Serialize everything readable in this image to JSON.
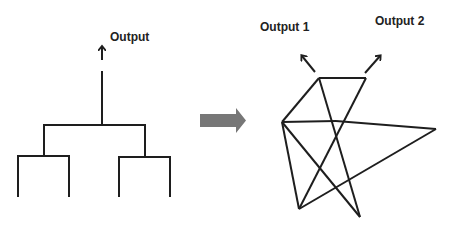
{
  "tree": {
    "output_label": "Output",
    "description": "Hierarchical tree: two leaf pairs merge into one output"
  },
  "transform_arrow": {
    "color": "#777777"
  },
  "network": {
    "output_labels": [
      "Output 1",
      "Output 2"
    ],
    "description": "Interconnected network with two outputs"
  },
  "colors": {
    "line": "#1e1e1e",
    "text": "#222222",
    "arrow_fill": "#777777",
    "background": "#ffffff"
  }
}
